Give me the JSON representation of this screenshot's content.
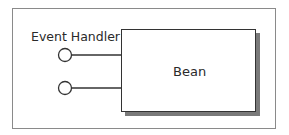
{
  "diagram": {
    "component": {
      "label": "Bean"
    },
    "interface_label": "Event Handler",
    "ports": [
      {
        "name": "port-1",
        "y": 55
      },
      {
        "name": "port-2",
        "y": 88
      }
    ],
    "colors": {
      "stroke": "#333333",
      "frame": "#8a8a8a",
      "shadow": "#7a7a7a",
      "background": "#ffffff"
    }
  }
}
